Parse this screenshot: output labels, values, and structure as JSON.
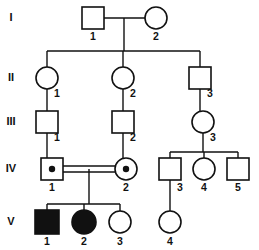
{
  "diagram": {
    "type": "pedigree",
    "colors": {
      "line": "#111111",
      "affected_fill": "#111111",
      "unaffected_fill": "#ffffff",
      "background": "#ffffff"
    },
    "legend_meaning": {
      "square": "male",
      "circle": "female",
      "filled": "affected",
      "open": "unaffected",
      "center_dot": "carrier",
      "double_line": "consanguineous mating"
    }
  },
  "generations": [
    {
      "label": "I",
      "y": 18
    },
    {
      "label": "II",
      "y": 78
    },
    {
      "label": "III",
      "y": 122
    },
    {
      "label": "IV",
      "y": 169
    },
    {
      "label": "V",
      "y": 222
    }
  ],
  "individuals": [
    {
      "id": "I-1",
      "number": "1",
      "generation": "I",
      "sex": "square",
      "status": "open",
      "carrier": false,
      "cx": 93,
      "cy": 18,
      "size": 22,
      "label_x": 93,
      "label_y": 37
    },
    {
      "id": "I-2",
      "number": "2",
      "generation": "I",
      "sex": "circle",
      "status": "open",
      "carrier": false,
      "cx": 156,
      "cy": 18,
      "size": 22,
      "label_x": 156,
      "label_y": 37
    },
    {
      "id": "II-1",
      "number": "1",
      "generation": "II",
      "sex": "circle",
      "status": "open",
      "carrier": false,
      "cx": 47,
      "cy": 78,
      "size": 22,
      "label_x": 57,
      "label_y": 94
    },
    {
      "id": "II-2",
      "number": "2",
      "generation": "II",
      "sex": "circle",
      "status": "open",
      "carrier": false,
      "cx": 123,
      "cy": 78,
      "size": 22,
      "label_x": 133,
      "label_y": 94
    },
    {
      "id": "II-3",
      "number": "3",
      "generation": "II",
      "sex": "square",
      "status": "open",
      "carrier": false,
      "cx": 200,
      "cy": 78,
      "size": 22,
      "label_x": 210,
      "label_y": 94
    },
    {
      "id": "III-1",
      "number": "1",
      "generation": "III",
      "sex": "square",
      "status": "open",
      "carrier": false,
      "cx": 47,
      "cy": 122,
      "size": 22,
      "label_x": 57,
      "label_y": 138
    },
    {
      "id": "III-2",
      "number": "2",
      "generation": "III",
      "sex": "square",
      "status": "open",
      "carrier": false,
      "cx": 123,
      "cy": 122,
      "size": 22,
      "label_x": 133,
      "label_y": 138
    },
    {
      "id": "III-3",
      "number": "3",
      "generation": "III",
      "sex": "circle",
      "status": "open",
      "carrier": false,
      "cx": 203,
      "cy": 122,
      "size": 22,
      "label_x": 213,
      "label_y": 138
    },
    {
      "id": "IV-1",
      "number": "1",
      "generation": "IV",
      "sex": "square",
      "status": "open",
      "carrier": true,
      "cx": 52,
      "cy": 169,
      "size": 22,
      "label_x": 52,
      "label_y": 188
    },
    {
      "id": "IV-2",
      "number": "2",
      "generation": "IV",
      "sex": "circle",
      "status": "open",
      "carrier": true,
      "cx": 126,
      "cy": 169,
      "size": 22,
      "label_x": 126,
      "label_y": 188
    },
    {
      "id": "IV-3",
      "number": "3",
      "generation": "IV",
      "sex": "square",
      "status": "open",
      "carrier": false,
      "cx": 170,
      "cy": 169,
      "size": 22,
      "label_x": 180,
      "label_y": 188
    },
    {
      "id": "IV-4",
      "number": "4",
      "generation": "IV",
      "sex": "circle",
      "status": "open",
      "carrier": false,
      "cx": 204,
      "cy": 169,
      "size": 22,
      "label_x": 204,
      "label_y": 188
    },
    {
      "id": "IV-5",
      "number": "5",
      "generation": "IV",
      "sex": "square",
      "status": "open",
      "carrier": false,
      "cx": 238,
      "cy": 169,
      "size": 22,
      "label_x": 238,
      "label_y": 188
    },
    {
      "id": "V-1",
      "number": "1",
      "generation": "V",
      "sex": "square",
      "status": "filled",
      "carrier": false,
      "cx": 47,
      "cy": 222,
      "size": 24,
      "label_x": 47,
      "label_y": 242
    },
    {
      "id": "V-2",
      "number": "2",
      "generation": "V",
      "sex": "circle",
      "status": "filled",
      "carrier": false,
      "cx": 84,
      "cy": 222,
      "size": 24,
      "label_x": 84,
      "label_y": 242
    },
    {
      "id": "V-3",
      "number": "3",
      "generation": "V",
      "sex": "circle",
      "status": "open",
      "carrier": false,
      "cx": 120,
      "cy": 222,
      "size": 22,
      "label_x": 120,
      "label_y": 242
    },
    {
      "id": "V-4",
      "number": "4",
      "generation": "V",
      "sex": "circle",
      "status": "open",
      "carrier": false,
      "cx": 170,
      "cy": 222,
      "size": 22,
      "label_x": 170,
      "label_y": 242
    }
  ],
  "connectors": [
    {
      "name": "mating-I1-I2",
      "d": "M 104 18 L 145 18"
    },
    {
      "name": "descent-I-to-sibline",
      "d": "M 124 18 L 124 51"
    },
    {
      "name": "sibline-gen-II",
      "d": "M 47 51 L 200 51"
    },
    {
      "name": "drop-II-1",
      "d": "M 47 51 L 47 67"
    },
    {
      "name": "drop-II-2",
      "d": "M 123 51 L 123 67"
    },
    {
      "name": "drop-II-3",
      "d": "M 200 51 L 200 67"
    },
    {
      "name": "link-II1-III1",
      "d": "M 47 89 L 47 111"
    },
    {
      "name": "link-II2-III2",
      "d": "M 123 89 L 123 111"
    },
    {
      "name": "link-II3-III3",
      "d": "M 200 89 L 200 111"
    },
    {
      "name": "link-III1-IV1",
      "d": "M 47 133 L 47 158"
    },
    {
      "name": "link-III2-IV2",
      "d": "M 123 133 L 123 158"
    },
    {
      "name": "link-III3-sibline-IV",
      "d": "M 203 133 L 203 152"
    },
    {
      "name": "sibline-gen-IV-right",
      "d": "M 170 152 L 238 152"
    },
    {
      "name": "drop-IV-3",
      "d": "M 170 152 L 170 158"
    },
    {
      "name": "drop-IV-4",
      "d": "M 204 152 L 204 158"
    },
    {
      "name": "drop-IV-5",
      "d": "M 238 152 L 238 158"
    },
    {
      "name": "consang-mating-top",
      "d": "M 63 166 L 115 166"
    },
    {
      "name": "consang-mating-bot",
      "d": "M 63 172 L 115 172"
    },
    {
      "name": "descent-IV-couple",
      "d": "M 89 169 L 89 204"
    },
    {
      "name": "sibline-gen-V",
      "d": "M 47 204 L 120 204"
    },
    {
      "name": "drop-V-1",
      "d": "M 47 204 L 47 210"
    },
    {
      "name": "drop-V-2",
      "d": "M 84 204 L 84 210"
    },
    {
      "name": "drop-V-3",
      "d": "M 120 204 L 120 211"
    },
    {
      "name": "link-IV3-V4",
      "d": "M 170 180 L 170 211"
    }
  ]
}
